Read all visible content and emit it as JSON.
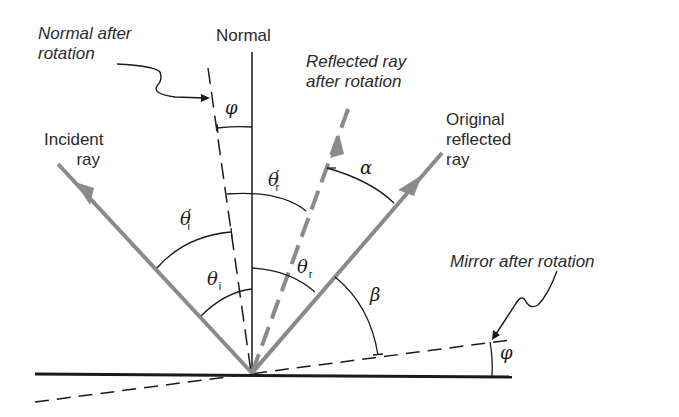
{
  "figure": {
    "labels": {
      "normal_after_rotation_line1": "Normal after",
      "normal_after_rotation_line2": "rotation",
      "normal": "Normal",
      "reflected_after_rotation_line1": "Reflected ray",
      "reflected_after_rotation_line2": "after rotation",
      "incident_line1": "Incident",
      "incident_line2": "ray",
      "original_reflected_line1": "Original",
      "original_reflected_line2": "reflected",
      "original_reflected_line3": "ray",
      "mirror_after_rotation": "Mirror after rotation"
    },
    "angles": {
      "phi_top": "φ",
      "theta_r_prime": "θ",
      "theta_r_prime_sub": "r",
      "prime_mark": "′",
      "alpha": "α",
      "theta_i_prime": "θ",
      "theta_i_prime_sub": "i",
      "theta_i": "θ",
      "theta_i_sub": "i",
      "theta_r": "θ",
      "theta_r_sub": "r",
      "beta": "β",
      "phi_bottom": "φ"
    },
    "colors": {
      "ray": "#8a8a8a",
      "line": "#1a1a1a",
      "text": "#2a2a2a"
    }
  }
}
